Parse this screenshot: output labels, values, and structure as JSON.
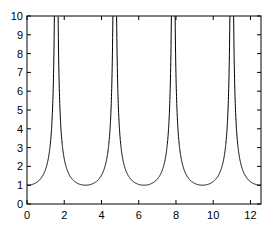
{
  "chart_data": {
    "type": "line",
    "title": "",
    "xlabel": "",
    "ylabel": "",
    "function": "y = 1/|cos(x)|",
    "xlim": [
      0,
      12.566
    ],
    "ylim": [
      0,
      10
    ],
    "grid": false,
    "legend": null,
    "x_ticks": [
      0,
      2,
      4,
      6,
      8,
      10,
      12
    ],
    "y_ticks": [
      0,
      1,
      2,
      3,
      4,
      5,
      6,
      7,
      8,
      9,
      10
    ],
    "series": [
      {
        "name": "curve",
        "color": "#000000",
        "x": [
          0,
          0.5,
          1.0,
          1.2,
          1.4,
          1.47,
          1.67,
          1.74,
          1.94,
          2.14,
          2.64,
          3.14,
          3.64,
          4.14,
          4.34,
          4.54,
          4.61,
          4.81,
          4.88,
          5.08,
          5.28,
          5.78,
          6.28,
          6.78,
          7.28,
          7.48,
          7.68,
          7.75,
          7.95,
          8.02,
          8.22,
          8.42,
          8.92,
          9.42,
          9.92,
          10.42,
          10.62,
          10.82,
          10.89,
          11.09,
          11.16,
          11.36,
          11.56,
          12.06,
          12.566
        ],
        "y": [
          1.0,
          1.14,
          1.85,
          2.76,
          5.88,
          10,
          10,
          5.88,
          2.76,
          1.85,
          1.14,
          1.0,
          1.14,
          1.85,
          2.76,
          5.88,
          10,
          10,
          5.88,
          2.76,
          1.85,
          1.14,
          1.0,
          1.14,
          1.85,
          2.76,
          5.88,
          10,
          10,
          5.88,
          2.76,
          1.85,
          1.14,
          1.0,
          1.14,
          1.85,
          2.76,
          5.88,
          10,
          10,
          5.88,
          2.76,
          1.85,
          1.14,
          1.0
        ]
      }
    ]
  }
}
